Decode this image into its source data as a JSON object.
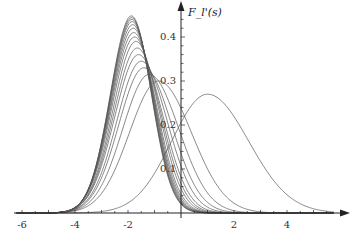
{
  "chart_data": {
    "type": "line",
    "title": "",
    "xlabel": "",
    "ylabel": "F_l'(s)",
    "xlim": [
      -6.2,
      5.8
    ],
    "ylim": [
      0,
      0.47
    ],
    "x_ticks": [
      -6,
      -4,
      -2,
      2,
      4
    ],
    "x_tick_labels": [
      "-6",
      "-4",
      "-2",
      "2",
      "4"
    ],
    "y_ticks": [
      0.1,
      0.2,
      0.3,
      0.4
    ],
    "y_tick_labels": [
      "0.1",
      "0.2",
      "0.3",
      "0.4"
    ],
    "grid": false,
    "legend": null,
    "line_color": "#555555",
    "series": [
      {
        "name": "l=1",
        "peak_s": 1.0,
        "peak_value": 0.27,
        "left_width": 1.35,
        "right_width": 1.55
      },
      {
        "name": "l=2",
        "peak_s": -0.85,
        "peak_value": 0.3,
        "left_width": 1.1,
        "right_width": 1.25
      },
      {
        "name": "l=3",
        "peak_s": -1.2,
        "peak_value": 0.315,
        "left_width": 1.0,
        "right_width": 1.12
      },
      {
        "name": "l=4",
        "peak_s": -1.4,
        "peak_value": 0.33,
        "left_width": 0.95,
        "right_width": 1.05
      },
      {
        "name": "l=5",
        "peak_s": -1.5,
        "peak_value": 0.345,
        "left_width": 0.92,
        "right_width": 0.98
      },
      {
        "name": "l=6",
        "peak_s": -1.6,
        "peak_value": 0.36,
        "left_width": 0.9,
        "right_width": 0.93
      },
      {
        "name": "l=7",
        "peak_s": -1.65,
        "peak_value": 0.375,
        "left_width": 0.88,
        "right_width": 0.89
      },
      {
        "name": "l=8",
        "peak_s": -1.7,
        "peak_value": 0.39,
        "left_width": 0.86,
        "right_width": 0.86
      },
      {
        "name": "l=9",
        "peak_s": -1.75,
        "peak_value": 0.4,
        "left_width": 0.85,
        "right_width": 0.83
      },
      {
        "name": "l=10",
        "peak_s": -1.78,
        "peak_value": 0.41,
        "left_width": 0.84,
        "right_width": 0.81
      },
      {
        "name": "l=11",
        "peak_s": -1.8,
        "peak_value": 0.42,
        "left_width": 0.83,
        "right_width": 0.79
      },
      {
        "name": "l=12",
        "peak_s": -1.82,
        "peak_value": 0.428,
        "left_width": 0.82,
        "right_width": 0.78
      },
      {
        "name": "l=13",
        "peak_s": -1.84,
        "peak_value": 0.435,
        "left_width": 0.81,
        "right_width": 0.77
      },
      {
        "name": "l=14",
        "peak_s": -1.85,
        "peak_value": 0.44,
        "left_width": 0.8,
        "right_width": 0.76
      },
      {
        "name": "l=15",
        "peak_s": -1.86,
        "peak_value": 0.444,
        "left_width": 0.8,
        "right_width": 0.755
      },
      {
        "name": "l=16",
        "peak_s": -1.87,
        "peak_value": 0.448,
        "left_width": 0.79,
        "right_width": 0.75
      }
    ]
  }
}
